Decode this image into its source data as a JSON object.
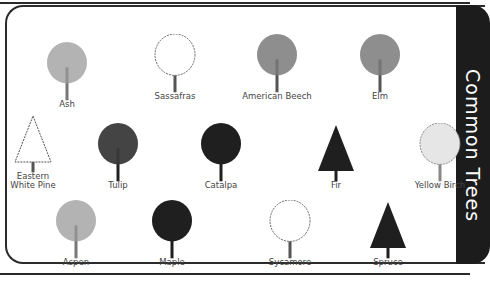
{
  "title": "Common Trees",
  "colors": {
    "frame": "#2b2b2b",
    "tab": "#1c1c1c",
    "label": "#444444"
  },
  "trees": [
    {
      "name": "Ash",
      "x": 67,
      "y": 104,
      "style": "light-gray"
    },
    {
      "name": "Sassafras",
      "x": 175,
      "y": 96,
      "style": "outline"
    },
    {
      "name": "American Beech",
      "x": 277,
      "y": 96,
      "style": "gray"
    },
    {
      "name": "Elm",
      "x": 380,
      "y": 96,
      "style": "gray"
    },
    {
      "name": "Eastern\nWhite Pine",
      "x": 33,
      "y": 185,
      "style": "outline-pine"
    },
    {
      "name": "Tulip",
      "x": 118,
      "y": 185,
      "style": "dark"
    },
    {
      "name": "Catalpa",
      "x": 221,
      "y": 185,
      "style": "black"
    },
    {
      "name": "Fir",
      "x": 336,
      "y": 185,
      "style": "black-conifer"
    },
    {
      "name": "Yellow Birch",
      "x": 440,
      "y": 185,
      "style": "light-outline"
    },
    {
      "name": "Aspen",
      "x": 76,
      "y": 262,
      "style": "light-gray"
    },
    {
      "name": "Maple",
      "x": 172,
      "y": 262,
      "style": "black"
    },
    {
      "name": "Sycamore",
      "x": 290,
      "y": 262,
      "style": "outline"
    },
    {
      "name": "Spruce",
      "x": 388,
      "y": 262,
      "style": "black-conifer"
    }
  ]
}
